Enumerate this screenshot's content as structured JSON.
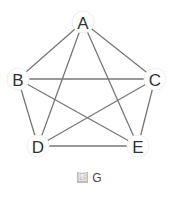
{
  "graph": {
    "nodes": [
      {
        "id": "A",
        "x": 83,
        "y": 22
      },
      {
        "id": "B",
        "x": 18,
        "y": 79
      },
      {
        "id": "C",
        "x": 155,
        "y": 79
      },
      {
        "id": "D",
        "x": 38,
        "y": 146
      },
      {
        "id": "E",
        "x": 138,
        "y": 146
      }
    ],
    "edges": [
      [
        "A",
        "B"
      ],
      [
        "A",
        "C"
      ],
      [
        "A",
        "D"
      ],
      [
        "A",
        "E"
      ],
      [
        "B",
        "C"
      ],
      [
        "B",
        "D"
      ],
      [
        "B",
        "E"
      ],
      [
        "C",
        "D"
      ],
      [
        "C",
        "E"
      ],
      [
        "D",
        "E"
      ]
    ],
    "edge_color": "#777777",
    "node_fill": "#ffffff"
  },
  "caption": {
    "prefix": "图",
    "label": "G"
  }
}
